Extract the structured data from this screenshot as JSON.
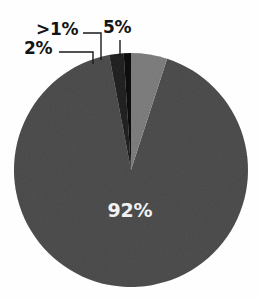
{
  "chart_data": {
    "type": "pie",
    "title": "",
    "subtitle": "",
    "xlabel": "",
    "ylabel": "",
    "legend": "none",
    "grid": false,
    "value_suffix": "%",
    "start_angle_deg": 0,
    "direction": "clockwise",
    "categories": [
      "5%",
      "92%",
      "2%",
      ">1%"
    ],
    "values": [
      5,
      92,
      2,
      0.5
    ],
    "slices": [
      {
        "label": "5%",
        "value": 5,
        "color": "#b2b2b2",
        "label_placement": "outside-callout",
        "start_deg": 0,
        "end_deg": 18
      },
      {
        "label": "92%",
        "value": 92,
        "color": "#8b8b8b",
        "label_placement": "inside",
        "label_color": "#f2f2f2",
        "start_deg": 18,
        "end_deg": 349.2
      },
      {
        "label": "2%",
        "value": 2,
        "color": "#5c5c5c",
        "label_placement": "outside-callout",
        "start_deg": 349.2,
        "end_deg": 356.4
      },
      {
        "label": ">1%",
        "value": 0.5,
        "color": "#3e3e3e",
        "label_placement": "outside-callout",
        "start_deg": 356.4,
        "end_deg": 360
      }
    ]
  },
  "chart": {
    "center_x": 131,
    "center_y": 170,
    "radius": 117,
    "background_color": "#fefefe",
    "leader_line_color": "#1a1a1a"
  },
  "labels": {
    "gt_one_percent": ">1%",
    "two_percent": "2%",
    "five_percent": "5%",
    "ninety_two_percent": "92%"
  }
}
